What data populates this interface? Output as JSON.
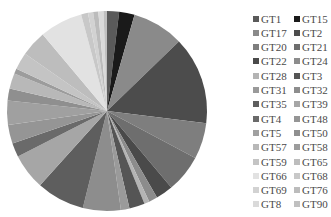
{
  "chart_data": {
    "type": "pie",
    "title": "",
    "legend_position": "right",
    "start_angle_deg": 0,
    "direction": "clockwise",
    "labels": [
      "GT1",
      "GT15",
      "GT17",
      "GT2",
      "GT20",
      "GT21",
      "GT22",
      "GT24",
      "GT28",
      "GT3",
      "GT31",
      "GT32",
      "GT35",
      "GT39",
      "GT4",
      "GT48",
      "GT5",
      "GT50",
      "GT57",
      "GT58",
      "GT59",
      "GT65",
      "GT66",
      "GT68",
      "GT69",
      "GT76",
      "GT8",
      "GT90"
    ],
    "values_deg": [
      7,
      9,
      30,
      51,
      21,
      22,
      10,
      5,
      3,
      9,
      5,
      22,
      28,
      21,
      8,
      11,
      14,
      7,
      9,
      3,
      10,
      15,
      25,
      4,
      3,
      3,
      3,
      2
    ],
    "values_pct": [
      1.9,
      2.5,
      8.3,
      14.2,
      5.8,
      6.1,
      2.8,
      1.4,
      0.8,
      2.5,
      1.4,
      6.1,
      7.8,
      5.8,
      2.2,
      3.1,
      3.9,
      1.9,
      2.5,
      0.8,
      2.8,
      4.2,
      6.9,
      1.1,
      0.8,
      0.8,
      0.8,
      0.6
    ],
    "colors": [
      "#5a5a5a",
      "#1a1a1a",
      "#8a8a8a",
      "#4c4c4c",
      "#7e7e7e",
      "#6e6e6e",
      "#4a4a4a",
      "#8c8c8c",
      "#b4b4b4",
      "#555555",
      "#9a9a9a",
      "#8d8d8d",
      "#5e5e5e",
      "#a6a6a6",
      "#6a6a6a",
      "#959595",
      "#a0a0a0",
      "#8f8f8f",
      "#b8b8b8",
      "#9c9c9c",
      "#c4c4c4",
      "#bdbdbd",
      "#e2e2e2",
      "#c8c8c8",
      "#d2d2d2",
      "#bcbcbc",
      "#dadada",
      "#c0c0c0"
    ]
  },
  "pie": {
    "cx": 107,
    "cy": 111,
    "r": 100
  },
  "legend": {
    "columns": [
      [
        "GT1",
        "GT17",
        "GT20",
        "GT22",
        "GT28",
        "GT31",
        "GT35",
        "GT4",
        "GT5",
        "GT57",
        "GT59",
        "GT66",
        "GT69",
        "GT8"
      ],
      [
        "GT15",
        "GT2",
        "GT21",
        "GT24",
        "GT3",
        "GT32",
        "GT39",
        "GT48",
        "GT50",
        "GT58",
        "GT65",
        "GT68",
        "GT76",
        "GT90"
      ]
    ]
  }
}
